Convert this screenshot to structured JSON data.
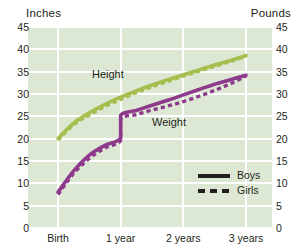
{
  "axes": {
    "left_title": "Inches",
    "right_title": "Pounds",
    "y_ticks": [
      "45",
      "40",
      "35",
      "30",
      "25",
      "20",
      "15",
      "10",
      "5",
      "0"
    ],
    "x_ticks": [
      "Birth",
      "1 year",
      "2 years",
      "3 years"
    ]
  },
  "series_labels": {
    "height": "Height",
    "weight": "Weight"
  },
  "legend": {
    "boys": "Boys",
    "girls": "Girls"
  },
  "colors": {
    "height": "#a5be4e",
    "weight": "#8e3a8c",
    "plot_background": "#dde8d4",
    "gridline": "#ffffff",
    "legend_line": "#231f20",
    "text": "#231f20"
  },
  "chart_data": {
    "type": "line",
    "title": "",
    "xlabel": "",
    "ylabel": "Inches",
    "y2label": "Pounds",
    "ylim": [
      0,
      45
    ],
    "y2lim": [
      0,
      45
    ],
    "grid": true,
    "legend_position": "inside-bottom-right",
    "x_categories": [
      "Birth",
      "1 year",
      "2 years",
      "3 years"
    ],
    "x_values": [
      0,
      1,
      2,
      3
    ],
    "series": [
      {
        "name": "Height Boys",
        "measure": "Height",
        "group": "Boys",
        "axis": "left",
        "unit": "inches",
        "style": "solid",
        "color": "#a5be4e",
        "x": [
          0,
          0.25,
          0.5,
          0.75,
          1,
          1.25,
          1.5,
          1.75,
          2,
          2.25,
          2.5,
          2.75,
          3
        ],
        "values": [
          20.0,
          23.5,
          25.8,
          27.7,
          29.3,
          30.7,
          32.0,
          33.2,
          34.3,
          35.4,
          36.5,
          37.5,
          38.6
        ]
      },
      {
        "name": "Height Girls",
        "measure": "Height",
        "group": "Girls",
        "axis": "left",
        "unit": "inches",
        "style": "dashed",
        "color": "#a5be4e",
        "x": [
          0,
          0.25,
          0.5,
          0.75,
          1,
          1.25,
          1.5,
          1.75,
          2,
          2.25,
          2.5,
          2.75,
          3
        ],
        "values": [
          19.7,
          23.1,
          25.3,
          27.2,
          28.8,
          30.3,
          31.6,
          32.8,
          34.0,
          35.1,
          36.2,
          37.3,
          38.4
        ]
      },
      {
        "name": "Weight Boys",
        "measure": "Weight",
        "group": "Boys",
        "axis": "right",
        "unit": "pounds",
        "style": "solid",
        "color": "#8e3a8c",
        "x": [
          0,
          0.25,
          0.5,
          0.75,
          1,
          1.0,
          1.25,
          1.5,
          1.75,
          2,
          2.25,
          2.5,
          2.75,
          3
        ],
        "values": [
          8.0,
          12.8,
          16.3,
          18.5,
          20.2,
          25.2,
          26.3,
          27.5,
          28.6,
          29.8,
          31.0,
          32.2,
          33.2,
          34.2
        ]
      },
      {
        "name": "Weight Girls",
        "measure": "Weight",
        "group": "Girls",
        "axis": "right",
        "unit": "pounds",
        "style": "dashed",
        "color": "#8e3a8c",
        "x": [
          0,
          0.25,
          0.5,
          0.75,
          1,
          1.0,
          1.25,
          1.5,
          1.75,
          2,
          2.25,
          2.5,
          2.75,
          3
        ],
        "values": [
          7.5,
          12.2,
          15.6,
          17.9,
          19.6,
          24.4,
          25.4,
          26.4,
          27.3,
          28.3,
          29.5,
          30.8,
          32.3,
          34.0
        ]
      }
    ],
    "annotations": [
      {
        "text": "Height",
        "x": 0.8,
        "y": 35.2
      },
      {
        "text": "Weight",
        "x": 1.55,
        "y": 24.2
      }
    ]
  }
}
